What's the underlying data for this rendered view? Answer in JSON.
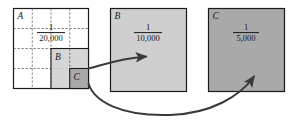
{
  "figure": {
    "type": "nested-scale-diagram",
    "background": "#ffffff",
    "width": 292,
    "height": 121
  },
  "colors": {
    "stroke": "#1a1a1a",
    "grid_dash": "#5a5a5a",
    "panel_a_fill": "#ffffff",
    "panel_b_fill": "#cfcfcf",
    "panel_c_fill": "#a9a9a9",
    "arrow": "#3a3a3a",
    "text": "#1a1a1a"
  },
  "panels": [
    {
      "id": "A",
      "label": "A",
      "scale_numerator": "1",
      "scale_denominator": "20,000",
      "fill": "#ffffff",
      "grid": true,
      "grid_divisions": 4
    },
    {
      "id": "B",
      "label": "B",
      "scale_numerator": "1",
      "scale_denominator": "10,000",
      "fill": "#cfcfcf",
      "grid": false
    },
    {
      "id": "C",
      "label": "C",
      "scale_numerator": "1",
      "scale_denominator": "5,000",
      "fill": "#a9a9a9",
      "grid": false
    }
  ],
  "insets": [
    {
      "id": "B",
      "label": "B",
      "fill": "#cfcfcf"
    },
    {
      "id": "C",
      "label": "C",
      "fill": "#a9a9a9"
    }
  ],
  "arrows": [
    {
      "id": "inset-b-to-panel-b",
      "from": "inset-B",
      "to": "panel-B"
    },
    {
      "id": "inset-c-to-panel-c",
      "from": "inset-C",
      "to": "panel-C"
    }
  ]
}
